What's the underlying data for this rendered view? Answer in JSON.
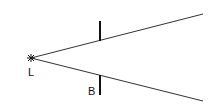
{
  "diagram": {
    "source": {
      "label": "L",
      "x": 31,
      "y": 58
    },
    "rays": [
      {
        "name": "upper",
        "x1": 31,
        "y1": 58,
        "x2": 203,
        "y2": 14
      },
      {
        "name": "lower",
        "x1": 31,
        "y1": 58,
        "x2": 203,
        "y2": 101
      }
    ],
    "barrier": {
      "label": "B",
      "x": 100,
      "top": {
        "y1": 21,
        "y2": 41
      },
      "bottom": {
        "y1": 75,
        "y2": 95
      }
    },
    "colors": {
      "stroke": "#222222",
      "background": "#ffffff"
    }
  }
}
